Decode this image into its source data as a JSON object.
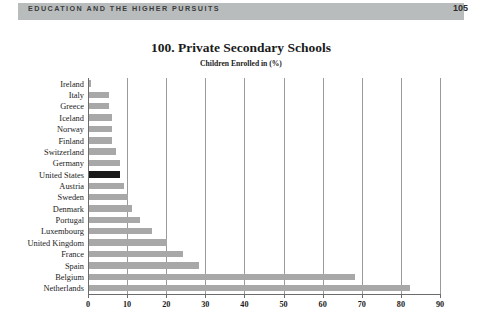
{
  "header": {
    "running_title": "EDUCATION AND THE HIGHER PURSUITS",
    "page_number": "105",
    "band_color": "#b9bcbc"
  },
  "chart_data": {
    "type": "bar",
    "orientation": "horizontal",
    "title": "100. Private Secondary Schools",
    "subtitle": "Children Enrolled in (%)",
    "xlabel": "",
    "ylabel": "",
    "xlim": [
      0,
      90
    ],
    "grid": true,
    "legend": null,
    "highlight_category": "United States",
    "bar_color": "#a8a8a8",
    "highlight_color": "#1a1a1a",
    "x_ticks": [
      0,
      10,
      20,
      30,
      40,
      50,
      60,
      70,
      80,
      90
    ],
    "x_tick_labels": [
      "0",
      "10",
      "20",
      "30",
      "40",
      "50",
      "60",
      "70",
      "80",
      "90"
    ],
    "categories": [
      "Ireland",
      "Italy",
      "Greece",
      "Iceland",
      "Norway",
      "Finland",
      "Switzerland",
      "Germany",
      "United States",
      "Austria",
      "Sweden",
      "Denmark",
      "Portugal",
      "Luxembourg",
      "United Kingdom",
      "France",
      "Spain",
      "Belgium",
      "Netherlands"
    ],
    "values": [
      0.5,
      5,
      5,
      6,
      6,
      6,
      7,
      8,
      8,
      9,
      10,
      11,
      13,
      16,
      20,
      24,
      28,
      68,
      82
    ]
  }
}
